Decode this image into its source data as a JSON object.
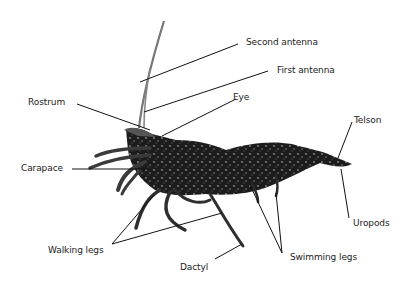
{
  "diagram": {
    "labels": {
      "second_antenna": "Second antenna",
      "first_antenna": "First antenna",
      "rostrum": "Rostrum",
      "eye": "Eye",
      "telson": "Telson",
      "carapace": "Carapace",
      "uropods": "Uropods",
      "walking_legs": "Walking legs",
      "swimming_legs": "Swimming legs",
      "dactyl": "Dactyl"
    },
    "colors": {
      "line": "#111111",
      "body_dark": "#1a1a1a",
      "body_mid": "#3a3a3a",
      "speckle": "#9a9a9a",
      "text": "#222222"
    }
  }
}
